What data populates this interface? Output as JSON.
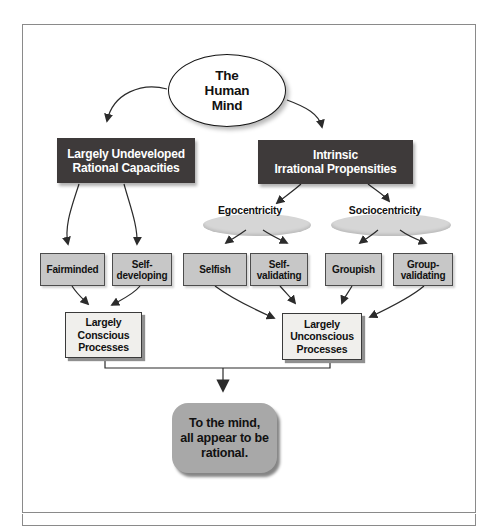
{
  "figure": {
    "nodes": {
      "root": "The\nHuman\nMind",
      "rational": "Largely Undeveloped\nRational Capacities",
      "irrational": "Intrinsic\nIrrational Propensities",
      "egocentricity": "Egocentricity",
      "sociocentricity": "Sociocentricity",
      "fairminded": "Fairminded",
      "self_developing": "Self-\ndeveloping",
      "selfish": "Selfish",
      "self_validating": "Self-\nvalidating",
      "groupish": "Groupish",
      "group_validating": "Group-\nvalidating",
      "conscious": "Largely\nConscious\nProcesses",
      "unconscious": "Largely\nUnconscious\nProcesses",
      "conclusion": "To the mind,\nall appear to be\nrational."
    },
    "colors": {
      "header_box": "#3e3a3a",
      "header_text": "#ffffff",
      "trait_box": "#c7c7c7",
      "process_box": "#f0efec",
      "conclusion_box": "#a8a8a8",
      "ellipse_fill": "#d6d6d6",
      "line": "#2b2b2b",
      "frame_border": "#8a8a8a"
    }
  }
}
